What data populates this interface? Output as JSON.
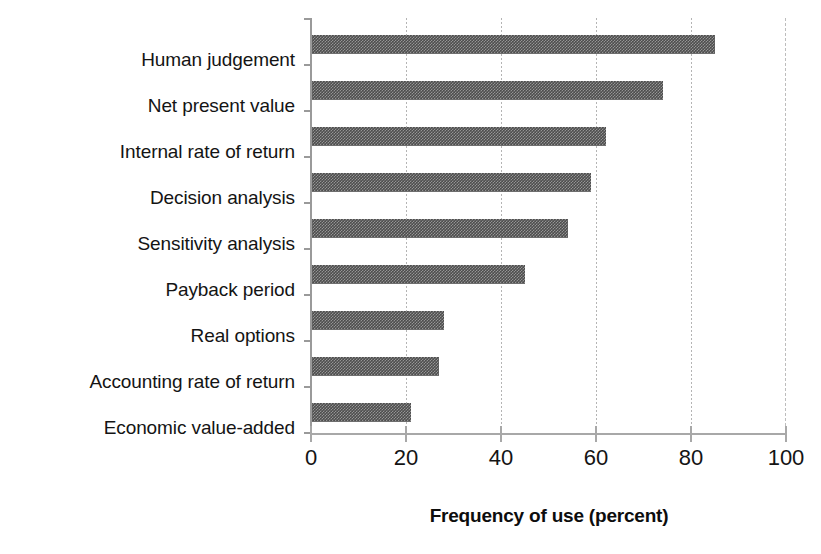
{
  "chart_data": {
    "type": "bar",
    "orientation": "horizontal",
    "title": "",
    "xlabel": "Frequency of use (percent)",
    "ylabel": "",
    "xlim": [
      0,
      100
    ],
    "xticks": [
      0,
      20,
      40,
      60,
      80,
      100
    ],
    "xtick_labels": [
      "0",
      "20",
      "40",
      "60",
      "80",
      "100"
    ],
    "grid": true,
    "grid_axis": "x",
    "legend": false,
    "categories": [
      "Human judgement",
      "Net present value",
      "Internal rate of return",
      "Decision analysis",
      "Sensitivity analysis",
      "Payback period",
      "Real options",
      "Accounting rate of return",
      "Economic value-added"
    ],
    "values": [
      85,
      74,
      62,
      59,
      54,
      45,
      28,
      27,
      21
    ],
    "bar_color": "#4d4d4d",
    "bar_pattern": "dithered-checker",
    "axis_color": "#9a9a9a",
    "grid_color": "#b4b4b4",
    "text_color": "#141414"
  }
}
